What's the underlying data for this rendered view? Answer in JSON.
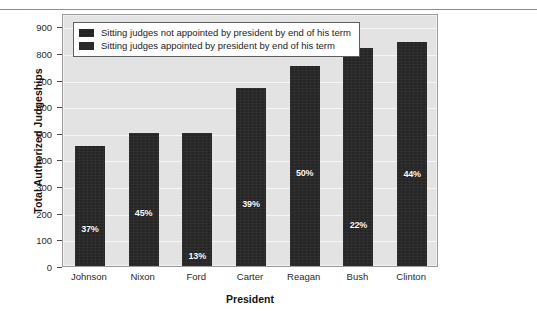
{
  "chart_data": {
    "type": "bar",
    "title": "",
    "xlabel": "President",
    "ylabel": "Total Authorized Judgeships",
    "categories": [
      "Johnson",
      "Nixon",
      "Ford",
      "Carter",
      "Reagan",
      "Bush",
      "Clinton"
    ],
    "values": [
      450,
      500,
      500,
      670,
      750,
      820,
      840
    ],
    "ylim": [
      0,
      950
    ],
    "yticks": [
      0,
      100,
      200,
      300,
      400,
      500,
      600,
      700,
      800,
      900
    ],
    "ytick_labels": [
      "0",
      "100",
      "200",
      "300",
      "400",
      "500",
      "600",
      "700",
      "800",
      "900"
    ],
    "grid": true,
    "legend_position": "upper-left",
    "series": [
      {
        "name": "Sitting judges not appointed by president by end of his term",
        "values": [
          283,
          275,
          435,
          409,
          375,
          640,
          470
        ]
      },
      {
        "name": "Sitting judges appointed by president by end of his term",
        "values": [
          167,
          225,
          65,
          261,
          375,
          180,
          370
        ]
      }
    ],
    "data_labels": [
      "37%",
      "45%",
      "13%",
      "39%",
      "50%",
      "22%",
      "44%"
    ],
    "data_label_values": [
      37,
      45,
      13,
      39,
      50,
      22,
      44
    ],
    "bar_color": "#262626",
    "plot_background": "#e3e3e3",
    "gridline_color": "#f6f6f6",
    "data_label_color": "#ffffff"
  },
  "legend": {
    "entries": [
      {
        "label": "Sitting judges not appointed by president by end of his term",
        "swatch_color": "#232323"
      },
      {
        "label": "Sitting judges appointed by president by end of his term",
        "swatch_color": "#2b2b2b"
      }
    ]
  },
  "axes": {
    "y_title": "Total Authorized Judgeships",
    "x_title": "President"
  }
}
